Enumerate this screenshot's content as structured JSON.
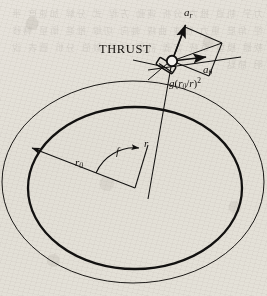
{
  "figure": {
    "background_color": "#f2f0ec",
    "ink_color": "#121110",
    "ghost_text": "力学 軌道 推力 分析 運動 方程 式 分解 加速度 半徑 角度 重力 加速 曲線 軸向 切線 推進 衛星 轉移 軟體 模型 系統 定義 計算 結果 數值 分析 圖表 說明 節點"
  },
  "labels": {
    "thrust": "THRUST",
    "a_radial": {
      "base": "a",
      "sub": "r"
    },
    "a_tangential": {
      "base": "a",
      "sub": "θ"
    },
    "gravity": {
      "fn": "g",
      "open": "(",
      "num": "r",
      "num_sub": "0",
      "slash": "/",
      "den": "r",
      "close": ")",
      "exp": "2"
    },
    "r_zero": {
      "base": "r",
      "sub": "0"
    },
    "r": {
      "base": "r"
    },
    "f_angle": {
      "base": "f"
    }
  },
  "geometry": {
    "center": {
      "x": 135,
      "y": 188
    },
    "spacecraft": {
      "x": 172,
      "y": 61
    },
    "inner_orbit": {
      "cx": 135,
      "cy": 188,
      "rx": 107,
      "ry": 81,
      "stroke_width": 2.2
    },
    "outer_orbit": {
      "cx": 133,
      "cy": 182,
      "rx": 131,
      "ry": 101,
      "stroke_width": 1.0
    },
    "a_radial_tip": {
      "x": 185,
      "y": 24
    },
    "a_tangent_tip": {
      "x": 213,
      "y": 43
    },
    "tangent_line": {
      "x1": 150,
      "y1": 70,
      "x2": 241,
      "y2": 58
    },
    "gravity_line": {
      "x1": 172,
      "y1": 61,
      "x2": 147,
      "y2": 196
    },
    "radius_line": {
      "x1": 135,
      "y1": 188,
      "x2": 150,
      "y2": 147
    },
    "r0_line": {
      "x1": 135,
      "y1": 188,
      "x2": 27,
      "y2": 146
    },
    "angle_arc_radius": 40
  },
  "label_positions": {
    "thrust": {
      "left": 99,
      "top": 42
    },
    "a_radial": {
      "left": 184,
      "top": 7
    },
    "a_tangential": {
      "left": 203,
      "top": 64
    },
    "gravity": {
      "left": 169,
      "top": 76
    },
    "r_zero": {
      "left": 75,
      "top": 157
    },
    "r": {
      "left": 143,
      "top": 138
    },
    "f_angle": {
      "left": 116,
      "top": 146
    }
  }
}
